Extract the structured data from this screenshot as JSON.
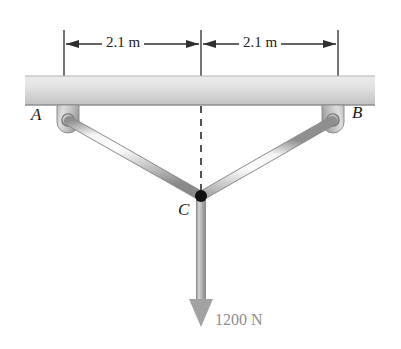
{
  "figure": {
    "background_color": "#ffffff"
  },
  "ceiling": {
    "label": "ceiling-slab",
    "fill_top": "#e9e9e9",
    "fill_bottom": "#c9c9c9",
    "edge_color": "#9a9a9a"
  },
  "dimensions": {
    "left": {
      "text": "2.1 m",
      "value": 2.1,
      "unit": "m"
    },
    "right": {
      "text": "2.1 m",
      "value": 2.1,
      "unit": "m"
    },
    "line_color": "#3a3a3a"
  },
  "points": {
    "a": {
      "label": "A",
      "role": "pin-support-left"
    },
    "b": {
      "label": "B",
      "role": "pin-support-right"
    },
    "c": {
      "label": "C",
      "role": "joint-node"
    }
  },
  "members": {
    "ac": {
      "name": "member-AC",
      "fill_light": "#fdfdfd",
      "fill_dark": "#9b9b9b"
    },
    "bc": {
      "name": "member-BC",
      "fill_light": "#fdfdfd",
      "fill_dark": "#9b9b9b"
    }
  },
  "centerline": {
    "name": "centerline-dashed",
    "color": "#2b2b2b",
    "style": "dashed"
  },
  "load": {
    "text": "1200 N",
    "value": 1200,
    "unit": "N",
    "direction": "down",
    "color": "#9d9d9d",
    "cable_name": "load-cable"
  },
  "supports": {
    "bracket_fill_light": "#d8d8d8",
    "bracket_fill_dark": "#a0a0a0",
    "pin_color": "#b5b5b5",
    "pin_edge": "#6f6f6f"
  }
}
